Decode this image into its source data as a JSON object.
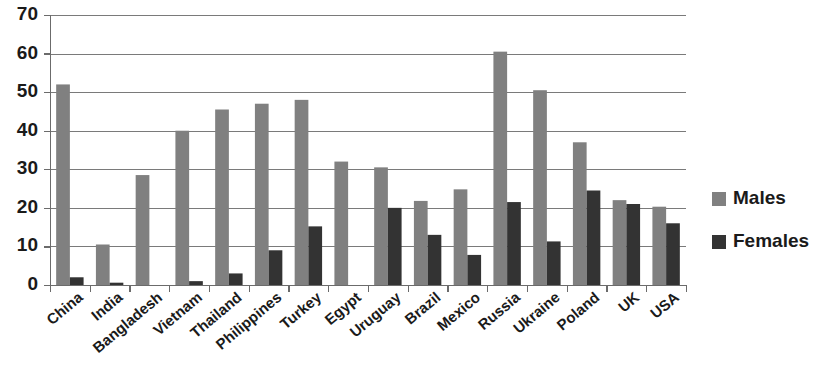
{
  "chart_data": {
    "type": "bar",
    "title": "",
    "subtitle": "",
    "xlabel": "",
    "ylabel": "",
    "ylim": [
      0,
      70
    ],
    "ytick_values": [
      0,
      10,
      20,
      30,
      40,
      50,
      60,
      70
    ],
    "ytick_labels": [
      "0",
      "10",
      "20",
      "30",
      "40",
      "50",
      "60",
      "70"
    ],
    "grid": true,
    "legend_position": "right",
    "categories": [
      "China",
      "India",
      "Bangladesh",
      "Vietnam",
      "Thailand",
      "Philippines",
      "Turkey",
      "Egypt",
      "Uruguay",
      "Brazil",
      "Mexico",
      "Russia",
      "Ukraine",
      "Poland",
      "UK",
      "USA"
    ],
    "series": [
      {
        "name": "Males",
        "color": "#808080",
        "values": [
          52,
          10.5,
          28.5,
          40,
          45.5,
          47,
          48,
          32,
          30.5,
          21.8,
          24.8,
          60.5,
          50.5,
          37,
          22,
          20.3
        ]
      },
      {
        "name": "Females",
        "color": "#333333",
        "values": [
          2,
          0.6,
          0,
          1,
          3,
          9,
          15.2,
          0,
          20,
          13,
          7.8,
          21.5,
          11.3,
          24.5,
          21,
          16
        ]
      }
    ]
  },
  "legend": {
    "items": [
      {
        "label": "Males",
        "color": "#808080"
      },
      {
        "label": "Females",
        "color": "#333333"
      }
    ]
  },
  "colors": {
    "males": "#808080",
    "females": "#333333",
    "gridline": "#7a7a7a",
    "axis": "#6b6b6b",
    "text": "#1a1a1a",
    "background": "#ffffff"
  }
}
